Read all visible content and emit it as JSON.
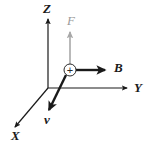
{
  "figure": {
    "background_color": "#ffffff",
    "width": 155,
    "height": 145
  },
  "axes": {
    "color": "#1a1a1a",
    "origin": {
      "x": 48,
      "y": 88
    },
    "items": [
      {
        "name": "z-axis",
        "label": "Z",
        "label_x": 43,
        "label_y": 13,
        "x1": 48,
        "y1": 88,
        "x2": 48,
        "y2": 19,
        "color": "#1a1a1a",
        "stroke_width": 1.2
      },
      {
        "name": "y-axis",
        "label": "Y",
        "label_x": 134,
        "label_y": 92,
        "x1": 48,
        "y1": 88,
        "x2": 127,
        "y2": 88,
        "color": "#1a1a1a",
        "stroke_width": 1.2
      },
      {
        "name": "x-axis",
        "label": "X",
        "label_x": 11,
        "label_y": 140,
        "x1": 48,
        "y1": 88,
        "x2": 15,
        "y2": 127,
        "color": "#1a1a1a",
        "stroke_width": 1.2
      }
    ]
  },
  "charge": {
    "name": "positive-charge",
    "symbol": "+",
    "cx": 70,
    "cy": 70,
    "r": 6,
    "stroke_color": "#2a2a2a",
    "fill_color": "#ffffff"
  },
  "vectors": [
    {
      "name": "force-vector",
      "label": "F",
      "label_x": 67,
      "label_y": 25,
      "x1": 70,
      "y1": 64,
      "x2": 70,
      "y2": 32,
      "color": "#a8a8a8",
      "stroke_width": 1.6,
      "description": "Force vector pointing up, drawn in light gray"
    },
    {
      "name": "magnetic-field-vector",
      "label": "B",
      "label_x": 114,
      "label_y": 72,
      "x1": 76,
      "y1": 70,
      "x2": 105,
      "y2": 70,
      "color": "#1a1a1a",
      "stroke_width": 2.4,
      "description": "Magnetic field vector pointing right along Y, bold black"
    },
    {
      "name": "velocity-vector",
      "label": "v",
      "label_x": 44,
      "label_y": 124,
      "x1": 66,
      "y1": 75,
      "x2": 49,
      "y2": 110,
      "color": "#1a1a1a",
      "stroke_width": 2.4,
      "description": "Velocity vector pointing down-left toward X, bold black"
    }
  ]
}
